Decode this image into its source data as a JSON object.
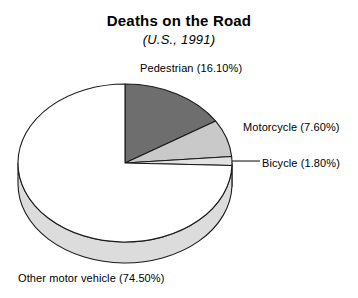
{
  "chart_data": {
    "type": "pie",
    "title": "Deaths on the Road",
    "subtitle": "(U.S., 1991)",
    "xlabel": "",
    "ylabel": "",
    "legend_position": "none",
    "grid": false,
    "three_d": true,
    "start_angle_deg": 0,
    "direction": "clockwise",
    "categories": [
      "Pedestrian",
      "Motorcycle",
      "Bicycle",
      "Other motor vehicle"
    ],
    "values": [
      16.1,
      7.6,
      1.8,
      74.5
    ],
    "value_unit": "%",
    "slices": [
      {
        "name": "Pedestrian",
        "value": 16.1,
        "label": "Pedestrian (16.10%)",
        "color": "#6e6e6e",
        "side_color": "#5a5a5a",
        "leader_line": false
      },
      {
        "name": "Motorcycle",
        "value": 7.6,
        "label": "Motorcycle (7.60%)",
        "color": "#c9c9c9",
        "side_color": "#b4b4b4",
        "leader_line": false
      },
      {
        "name": "Bicycle",
        "value": 1.8,
        "label": "Bicycle (1.80%)",
        "color": "#e2e2e2",
        "side_color": "#cfcfcf",
        "leader_line": true
      },
      {
        "name": "Other motor vehicle",
        "value": 74.5,
        "label": "Other motor vehicle (74.50%)",
        "color": "#ffffff",
        "side_color": "#dcdcdc",
        "leader_line": false
      }
    ],
    "outline_color": "#1a1a1a",
    "background_color": "#ffffff"
  }
}
